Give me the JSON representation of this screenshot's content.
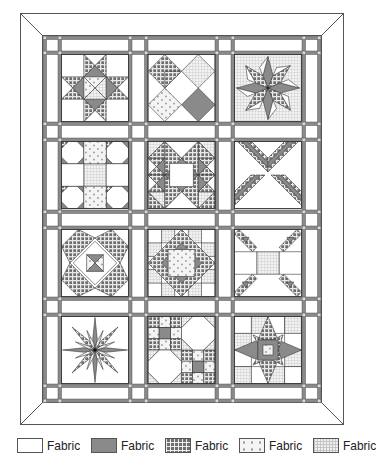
{
  "diagram": {
    "type": "quilt-layout",
    "layout": {
      "rows": 4,
      "columns": 3,
      "sashing": "double-strip with cornerstones",
      "border": "mitered frame"
    },
    "colors": {
      "fabric_white": "#ffffff",
      "fabric_gray": "#8a8a8a",
      "fabric_check": "#6e6e6e",
      "fabric_dot": "#f4f4f4",
      "fabric_cross": "#f0f0f0",
      "sashing": "#8a8a8a",
      "outline": "#444444"
    },
    "blocks": [
      {
        "row": 1,
        "col": 1,
        "name": "eight-point-star"
      },
      {
        "row": 1,
        "col": 2,
        "name": "diamond-squares"
      },
      {
        "row": 1,
        "col": 3,
        "name": "lemoyne-star"
      },
      {
        "row": 2,
        "col": 1,
        "name": "snowball-nine-patch"
      },
      {
        "row": 2,
        "col": 2,
        "name": "star-with-square-center"
      },
      {
        "row": 2,
        "col": 3,
        "name": "diagonal-strip-x"
      },
      {
        "row": 3,
        "col": 1,
        "name": "pinwheel-square"
      },
      {
        "row": 3,
        "col": 2,
        "name": "square-in-star"
      },
      {
        "row": 3,
        "col": 3,
        "name": "corner-arrows"
      },
      {
        "row": 4,
        "col": 1,
        "name": "eight-point-radiant-star"
      },
      {
        "row": 4,
        "col": 2,
        "name": "octagon-nine-patch"
      },
      {
        "row": 4,
        "col": 3,
        "name": "sawtooth-star"
      }
    ]
  },
  "legend": {
    "items": [
      {
        "swatch": "white",
        "label": "Fabric"
      },
      {
        "swatch": "gray",
        "label": "Fabric"
      },
      {
        "swatch": "check",
        "label": "Fabric"
      },
      {
        "swatch": "dot",
        "label": "Fabric"
      },
      {
        "swatch": "cross",
        "label": "Fabric"
      }
    ]
  }
}
